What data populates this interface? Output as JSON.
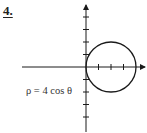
{
  "problem": {
    "number": "4."
  },
  "figure": {
    "equation": "ρ = 4 cos θ",
    "origin": [
      86,
      67
    ],
    "tick_spacing": 12.5,
    "circle": {
      "center": [
        111,
        67
      ],
      "radius": 25
    },
    "x_ticks": 3,
    "y_ticks_up": 4,
    "y_ticks_down": 4,
    "stroke_color": "#1a1a1a"
  }
}
